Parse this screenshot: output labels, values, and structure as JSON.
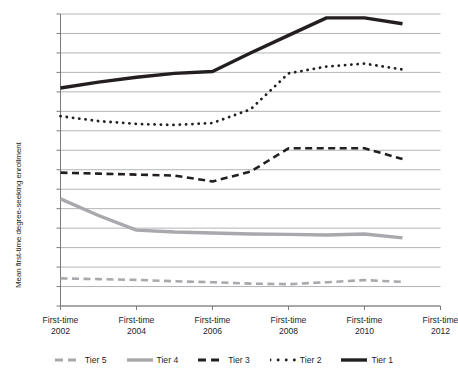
{
  "chart_data": {
    "type": "line",
    "title": "",
    "xlabel": "",
    "ylabel": "Mean first-time degree-seeking enrollment",
    "ylim": [
      0,
      1500
    ],
    "ytick_step": 100,
    "grid": true,
    "legend_position": "bottom",
    "x": [
      2002,
      2003,
      2004,
      2005,
      2006,
      2007,
      2008,
      2009,
      2010,
      2011,
      2012
    ],
    "categories": [
      "First-time 2002",
      "First-time 2003",
      "First-time 2004",
      "First-time 2005",
      "First-time 2006",
      "First-time 2007",
      "First-time 2008",
      "First-time 2009",
      "First-time 2010",
      "First-time 2011",
      "First-time 2012"
    ],
    "series": [
      {
        "name": "Tier 1",
        "style": "solid-thick",
        "color": "#231f20",
        "values": [
          1120,
          1150,
          1175,
          1195,
          1205,
          1300,
          1390,
          1480,
          1480,
          1450,
          null
        ]
      },
      {
        "name": "Tier 2",
        "style": "dotted",
        "color": "#231f20",
        "values": [
          975,
          950,
          935,
          930,
          940,
          1010,
          1195,
          1230,
          1245,
          1215,
          null
        ]
      },
      {
        "name": "Tier 3",
        "style": "dashed",
        "color": "#231f20",
        "values": [
          685,
          680,
          675,
          670,
          640,
          690,
          810,
          810,
          810,
          755,
          null
        ]
      },
      {
        "name": "Tier 4",
        "style": "solid-thick",
        "color": "#a7a9ac",
        "values": [
          550,
          465,
          390,
          380,
          375,
          370,
          368,
          365,
          370,
          350,
          null
        ]
      },
      {
        "name": "Tier 5",
        "style": "dashed",
        "color": "#a7a9ac",
        "values": [
          142,
          138,
          134,
          127,
          122,
          115,
          112,
          122,
          133,
          124,
          null
        ]
      }
    ],
    "ytick_labels": [
      "1,500",
      "1,400",
      "1,300",
      "1,200",
      "1,100",
      "1,000",
      "900",
      "800",
      "700",
      "600",
      "500",
      "400",
      "300",
      "200",
      "100",
      "0"
    ],
    "xtick_labels": [
      {
        "line1": "First-time",
        "line2": "2002"
      },
      {
        "line1": "First-time",
        "line2": "2004"
      },
      {
        "line1": "First-time",
        "line2": "2006"
      },
      {
        "line1": "First-time",
        "line2": "2008"
      },
      {
        "line1": "First-time",
        "line2": "2010"
      },
      {
        "line1": "First-time",
        "line2": "2012"
      }
    ],
    "legend": [
      {
        "label": "Tier 5",
        "color": "#a7a9ac",
        "style": "dashed"
      },
      {
        "label": "Tier 4",
        "color": "#a7a9ac",
        "style": "solid-thick"
      },
      {
        "label": "Tier 3",
        "color": "#231f20",
        "style": "dashed"
      },
      {
        "label": "Tier 2",
        "color": "#231f20",
        "style": "dotted"
      },
      {
        "label": "Tier 1",
        "color": "#231f20",
        "style": "solid-thick"
      }
    ],
    "colors": {
      "gridline": "#929497",
      "axis": "#6d6e71",
      "text": "#231f20",
      "tier_dark": "#231f20",
      "tier_gray": "#a7a9ac",
      "background": "#ffffff"
    }
  }
}
